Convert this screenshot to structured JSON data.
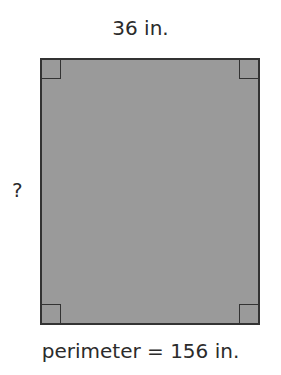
{
  "figure": {
    "shape": "rectangle",
    "top_label": "36 in.",
    "side_label": "?",
    "bottom_label": "perimeter = 156 in.",
    "fill_color": "#9a9a9a",
    "stroke_color": "#333333",
    "right_angle_markers": 4
  }
}
